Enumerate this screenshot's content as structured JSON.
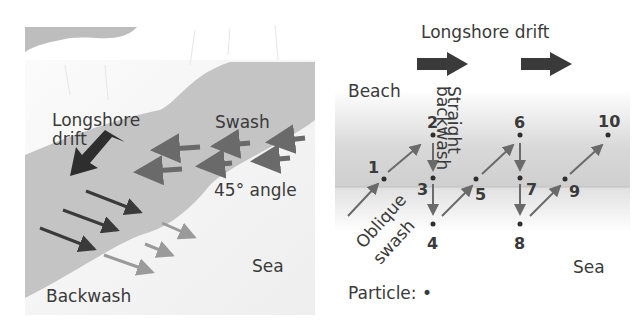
{
  "left_panel": {
    "labels": {
      "longshore_line1": "Longshore",
      "longshore_line2": "drift",
      "swash": "Swash",
      "angle": "45° angle",
      "sea": "Sea",
      "backwash": "Backwash"
    }
  },
  "right_panel": {
    "title": "Longshore drift",
    "beach": "Beach",
    "straight_backwash_line1": "Straight",
    "straight_backwash_line2": "backwash",
    "oblique_swash_line1": "Oblique",
    "oblique_swash_line2": "swash",
    "sea": "Sea",
    "particle_legend": "Particle: •",
    "points": [
      "1",
      "2",
      "3",
      "4",
      "5",
      "6",
      "7",
      "8",
      "9",
      "10"
    ]
  },
  "colors": {
    "beach": "#c4c4c4",
    "land": "#bdbdbd",
    "sea": "#f0f0f0",
    "dark_arrow": "#3a3a3a",
    "mid_arrow": "#6a6a6a",
    "light_arrow": "#9a9a9a",
    "text": "#3a3a3a"
  }
}
